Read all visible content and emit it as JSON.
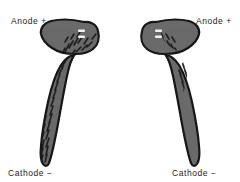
{
  "figure": {
    "title": "",
    "background_color": "#ffffff",
    "width": 240,
    "height": 182
  },
  "labels": {
    "anode_left": "Anode  +",
    "anode_right": "Anode  +",
    "cathode_left": "Cathode  −",
    "cathode_right": "Cathode  −",
    "text_color": "#1d1d1d"
  },
  "specimens": [
    {
      "id": "specimen-left",
      "name": "planarian-left",
      "orientation": "head-upper-right",
      "body_color": "#6a6a6a",
      "outline_color": "#171717",
      "texture_color": "#1c1c1c",
      "eyespot_color": "#f2f2f2",
      "eyespot_count": 2,
      "head_position": "top",
      "tail_position": "bottom"
    },
    {
      "id": "specimen-right",
      "name": "planarian-right",
      "orientation": "head-upper-left",
      "body_color": "#6a6a6a",
      "outline_color": "#171717",
      "texture_color": "#1c1c1c",
      "eyespot_color": "#f2f2f2",
      "eyespot_count": 2,
      "head_position": "top",
      "tail_position": "bottom"
    }
  ]
}
